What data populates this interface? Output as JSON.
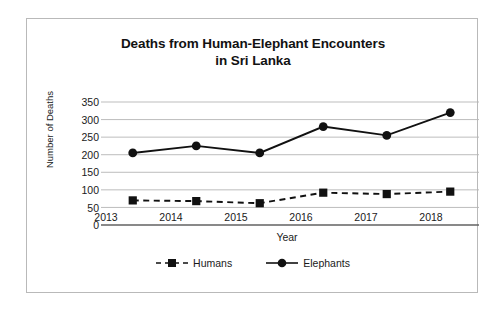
{
  "chart_data": {
    "type": "line",
    "title": "Deaths from Human-Elephant Encounters in Sri Lanka",
    "title_line1": "Deaths from Human-Elephant Encounters",
    "title_line2": "in Sri Lanka",
    "xlabel": "Year",
    "ylabel": "Number of Deaths",
    "categories": [
      "2013",
      "2014",
      "2015",
      "2016",
      "2017",
      "2018"
    ],
    "x": [
      2013,
      2014,
      2015,
      2016,
      2017,
      2018
    ],
    "ylim": [
      0,
      350
    ],
    "ytick_labels": [
      "350",
      "300",
      "250",
      "200",
      "150",
      "100",
      "50",
      "0"
    ],
    "ytick_values": [
      350,
      300,
      250,
      200,
      150,
      100,
      50,
      0
    ],
    "grid": true,
    "legend_position": "bottom",
    "series": [
      {
        "name": "Humans",
        "values": [
          70,
          68,
          62,
          92,
          88,
          95
        ],
        "line_style": "dashed",
        "marker": "square",
        "color": "#111111"
      },
      {
        "name": "Elephants",
        "values": [
          205,
          225,
          205,
          280,
          255,
          320
        ],
        "line_style": "solid",
        "marker": "circle",
        "color": "#111111"
      }
    ]
  },
  "frame": {
    "border_color": "#b9b9b9",
    "background": "#ffffff"
  }
}
